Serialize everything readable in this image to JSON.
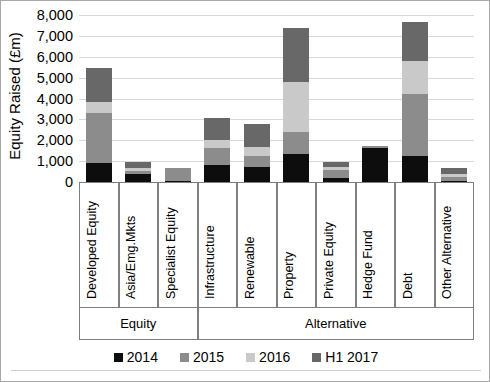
{
  "chart_data": {
    "type": "bar",
    "subtype": "stacked-vertical",
    "title": "",
    "xlabel": "",
    "ylabel": "Equity Raised (£m)",
    "ylim": [
      0,
      8000
    ],
    "ytick_step": 1000,
    "yticks": [
      "0",
      "1,000",
      "2,000",
      "3,000",
      "4,000",
      "5,000",
      "6,000",
      "7,000",
      "8,000"
    ],
    "ytick_values": [
      0,
      1000,
      2000,
      3000,
      4000,
      5000,
      6000,
      7000,
      8000
    ],
    "grid": true,
    "grid_axis": "y",
    "legend_position": "bottom",
    "categories": [
      "Developed Equity",
      "Asia/Emg.Mkts",
      "Specialist Equity",
      "Infrastructure",
      "Renewable",
      "Property",
      "Private Equity",
      "Hedge Fund",
      "Debt",
      "Other Alternative"
    ],
    "groups": [
      {
        "label": "Equity",
        "categories": [
          "Developed Equity",
          "Asia/Emg.Mkts",
          "Specialist Equity"
        ]
      },
      {
        "label": "Alternative",
        "categories": [
          "Infrastructure",
          "Renewable",
          "Property",
          "Private Equity",
          "Hedge Fund",
          "Debt",
          "Other Alternative"
        ]
      }
    ],
    "series": [
      {
        "name": "2014",
        "color": "#0d0d0d",
        "values": [
          900,
          380,
          60,
          800,
          720,
          1320,
          170,
          1650,
          1250,
          60
        ]
      },
      {
        "name": "2015",
        "color": "#8c8c8c",
        "values": [
          2430,
          130,
          610,
          810,
          530,
          1080,
          400,
          60,
          2950,
          170
        ]
      },
      {
        "name": "2016",
        "color": "#c9c9c9",
        "values": [
          520,
          180,
          0,
          380,
          450,
          2400,
          170,
          0,
          1600,
          150
        ]
      },
      {
        "name": "H1 2017",
        "color": "#686868",
        "values": [
          1620,
          250,
          0,
          1060,
          1100,
          2600,
          220,
          0,
          1850,
          270
        ]
      }
    ],
    "totals": [
      5470,
      940,
      670,
      3050,
      2800,
      7400,
      960,
      1710,
      7650,
      650
    ]
  },
  "legend": {
    "items": [
      {
        "label": "2014",
        "color": "#0d0d0d"
      },
      {
        "label": "2015",
        "color": "#8c8c8c"
      },
      {
        "label": "2016",
        "color": "#c9c9c9"
      },
      {
        "label": "H1 2017",
        "color": "#686868"
      }
    ]
  }
}
